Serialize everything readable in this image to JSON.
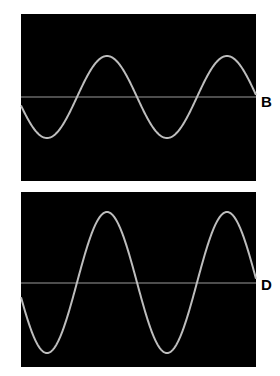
{
  "panels": [
    {
      "id": "B",
      "label": "B",
      "rect": {
        "x": 21,
        "y": 14,
        "w": 235,
        "h": 167
      },
      "baseline_y": 97,
      "wave": {
        "center_y": 97,
        "amplitude": 41,
        "period": 120,
        "trough_x": 47
      }
    },
    {
      "id": "D",
      "label": "D",
      "rect": {
        "x": 21,
        "y": 192,
        "w": 235,
        "h": 175
      },
      "baseline_y": 283,
      "wave": {
        "center_y": 282.5,
        "amplitude": 70.5,
        "period": 120,
        "trough_x": 47
      }
    }
  ],
  "colors": {
    "screen": "#000000",
    "wave": "#bdbdbd",
    "baseline": "#9a9a9a",
    "label": "#000000"
  }
}
